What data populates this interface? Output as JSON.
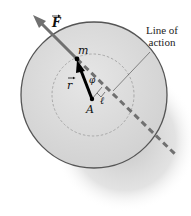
{
  "figure": {
    "labels": {
      "force": "F",
      "mass": "m",
      "radius_vector": "r",
      "pivot": "A",
      "angle": "φ",
      "lever_arm": "ℓ",
      "line_of_action_line1": "Line of",
      "line_of_action_line2": "action"
    },
    "colors": {
      "disk_fill": "#d9d9d9",
      "disk_edge": "#555555",
      "shadow": "#c8c8c8",
      "force_arrow": "#707070",
      "radius_arrow": "#000000",
      "dashed_circle": "#9a9a9a"
    }
  }
}
